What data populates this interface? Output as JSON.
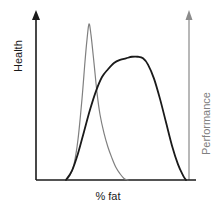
{
  "chart_data": {
    "type": "line",
    "title": "",
    "subtitle": "",
    "xlabel": "% fat",
    "ylabel": "Health",
    "ylabel_right": "Performance",
    "grid": false,
    "legend": "none",
    "axes": {
      "x": {
        "label": "% fat",
        "ticks": [],
        "range_described": "increasing body fat percentage"
      },
      "y_left": {
        "label": "Health",
        "ticks": [],
        "color": "#1a1a1a"
      },
      "y_right": {
        "label": "Performance",
        "ticks": [],
        "color": "#808080"
      }
    },
    "series": [
      {
        "name": "Health",
        "axis": "left",
        "color": "#808080",
        "stroke_width": 1.2,
        "shape": "narrow tall peak, rises steeply and falls with longer right tail",
        "points": [
          [
            66,
            0
          ],
          [
            70,
            3
          ],
          [
            74,
            10
          ],
          [
            78,
            26
          ],
          [
            82,
            52
          ],
          [
            85,
            76
          ],
          [
            87,
            90
          ],
          [
            89,
            100
          ],
          [
            91,
            93
          ],
          [
            94,
            75
          ],
          [
            97,
            56
          ],
          [
            100,
            42
          ],
          [
            104,
            30
          ],
          [
            108,
            21
          ],
          [
            112,
            14
          ],
          [
            116,
            8
          ],
          [
            120,
            4
          ],
          [
            124,
            1
          ],
          [
            128,
            0
          ]
        ]
      },
      {
        "name": "Performance",
        "axis": "right",
        "color": "#1a1a1a",
        "stroke_width": 1.8,
        "shape": "broad rounded plateau peaking later, steep sigmoid decline",
        "points": [
          [
            66,
            0
          ],
          [
            72,
            6
          ],
          [
            78,
            17
          ],
          [
            84,
            31
          ],
          [
            90,
            45
          ],
          [
            96,
            57
          ],
          [
            102,
            66
          ],
          [
            108,
            71
          ],
          [
            114,
            75
          ],
          [
            120,
            77
          ],
          [
            126,
            78
          ],
          [
            132,
            79
          ],
          [
            138,
            79
          ],
          [
            143,
            78
          ],
          [
            148,
            74
          ],
          [
            154,
            65
          ],
          [
            160,
            52
          ],
          [
            166,
            37
          ],
          [
            172,
            22
          ],
          [
            178,
            10
          ],
          [
            183,
            3
          ],
          [
            186,
            0
          ]
        ]
      }
    ]
  },
  "labels": {
    "x_axis": "% fat",
    "y_axis_left": "Health",
    "y_axis_right": "Performance"
  },
  "colors": {
    "health_curve": "#808080",
    "performance_curve": "#1a1a1a",
    "axis_left": "#1a1a1a",
    "axis_right": "#8c8c8c",
    "baseline": "#1a1a1a"
  }
}
